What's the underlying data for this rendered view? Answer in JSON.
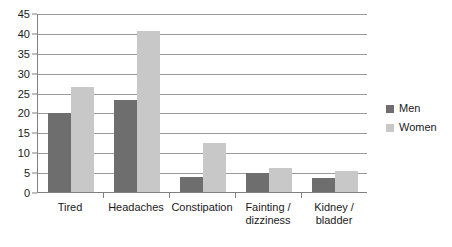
{
  "chart_data": {
    "type": "bar",
    "title": "",
    "xlabel": "",
    "ylabel": "",
    "ylim": [
      0,
      45
    ],
    "ytick_step": 5,
    "yticks": [
      0,
      5,
      10,
      15,
      20,
      25,
      30,
      35,
      40,
      45
    ],
    "ytick_labels": [
      "0",
      "5",
      "10",
      "15",
      "20",
      "25",
      "30",
      "35",
      "40",
      "45"
    ],
    "grid": true,
    "grid_axis": "y",
    "legend_position": "right",
    "categories": [
      "Tired",
      "Headaches",
      "Constipation",
      "Fainting /\ndizziness",
      "Kidney /\nbladder"
    ],
    "series": [
      {
        "name": "Men",
        "color": "#6e6e6e",
        "values": [
          19.8,
          23.2,
          3.8,
          4.9,
          3.5
        ]
      },
      {
        "name": "Women",
        "color": "#c8c8c8",
        "values": [
          26.5,
          40.6,
          12.2,
          6.1,
          5.3
        ]
      }
    ]
  },
  "legend": {
    "items": [
      {
        "label": "Men",
        "swatch": "men"
      },
      {
        "label": "Women",
        "swatch": "women"
      }
    ]
  },
  "colors": {
    "men": "#6e6e6e",
    "women": "#c8c8c8",
    "gridline": "#9a9a9a",
    "axis": "#808080",
    "text": "#1a1a1a",
    "background": "#ffffff"
  }
}
